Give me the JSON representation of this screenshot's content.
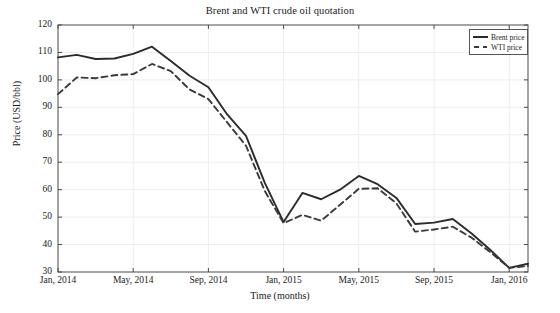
{
  "chart_data": {
    "type": "line",
    "title": "Brent and WTI crude oil quotation",
    "xlabel": "Time (months)",
    "ylabel": "Price (USD/bbl)",
    "grid": true,
    "legend_position": "top-right",
    "ylim": [
      30,
      120
    ],
    "yticks": [
      30,
      40,
      50,
      60,
      70,
      80,
      90,
      100,
      110,
      120
    ],
    "ytick_labels": [
      "30",
      "40",
      "50",
      "60",
      "70",
      "80",
      "90",
      "100",
      "110",
      "120"
    ],
    "xticks": [
      0,
      4,
      8,
      12,
      16,
      20,
      24
    ],
    "xtick_labels": [
      "Jan, 2014",
      "May, 2014",
      "Sep, 2014",
      "Jan, 2015",
      "May, 2015",
      "Sep, 2015",
      "Jan, 2016"
    ],
    "x": [
      0,
      1,
      2,
      3,
      4,
      5,
      6,
      7,
      8,
      9,
      10,
      11,
      12,
      13,
      14,
      15,
      16,
      17,
      18,
      19,
      20,
      21,
      22,
      23,
      24,
      25
    ],
    "x_labels": [
      "Jan, 2014",
      "Feb, 2014",
      "Mar, 2014",
      "Apr, 2014",
      "May, 2014",
      "Jun, 2014",
      "Jul, 2014",
      "Aug, 2014",
      "Sep, 2014",
      "Oct, 2014",
      "Nov, 2014",
      "Dec, 2014",
      "Jan, 2015",
      "Feb, 2015",
      "Mar, 2015",
      "Apr, 2015",
      "May, 2015",
      "Jun, 2015",
      "Jul, 2015",
      "Aug, 2015",
      "Sep, 2015",
      "Oct, 2015",
      "Nov, 2015",
      "Dec, 2015",
      "Jan, 2016",
      "Feb, 2016"
    ],
    "series": [
      {
        "name": "Brent price",
        "style": "solid",
        "color": "#2b2b2b",
        "values": [
          108.2,
          109.1,
          107.6,
          107.8,
          109.5,
          112.1,
          106.9,
          101.5,
          97.3,
          87.4,
          79.6,
          62.5,
          48.2,
          58.8,
          56.5,
          60.0,
          65.0,
          62.0,
          57.0,
          47.5,
          48.0,
          49.3,
          44.0,
          38.0,
          31.5,
          33.0
        ]
      },
      {
        "name": "WTI price",
        "style": "dashed",
        "color": "#3a3a3a",
        "values": [
          94.8,
          100.9,
          100.6,
          101.7,
          102.1,
          105.8,
          103.2,
          96.5,
          93.0,
          84.5,
          76.0,
          59.5,
          47.8,
          50.8,
          48.7,
          54.5,
          60.3,
          60.5,
          55.0,
          44.7,
          45.5,
          46.5,
          42.5,
          37.2,
          31.5,
          32.2
        ]
      }
    ]
  },
  "legend": {
    "items": [
      {
        "label": "Brent price",
        "style": "solid"
      },
      {
        "label": "WTI price",
        "style": "dashed"
      }
    ]
  },
  "axes": {
    "plot_left": 58,
    "plot_right": 528,
    "plot_top": 25,
    "plot_bottom": 272
  }
}
